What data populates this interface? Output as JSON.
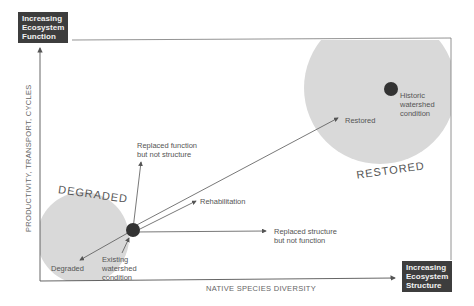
{
  "diagram": {
    "corner_labels": {
      "top_left": "Increasing Ecosystem Function",
      "top_left_lines": [
        "Increasing",
        "Ecosystem",
        "Function"
      ],
      "bottom_right": "Increasing Ecosystem Structure",
      "bottom_right_lines": [
        "Increasing",
        "Ecosystem",
        "Structure"
      ]
    },
    "axes": {
      "y_label": "PRODUCTIVITY, TRANSPORT, CYCLES",
      "x_label": "NATIVE SPECIES DIVERSITY"
    },
    "regions": {
      "degraded": "DEGRADED",
      "restored": "RESTORED"
    },
    "points": {
      "existing": [
        "Existing",
        "watershed",
        "condition"
      ],
      "historic": [
        "Historic",
        "watershed",
        "condition"
      ]
    },
    "arrows": {
      "replaced_function": [
        "Replaced function",
        "but not structure"
      ],
      "rehabilitation": "Rehabilitation",
      "replaced_structure": [
        "Replaced structure",
        "but not function"
      ],
      "restored": "Restored",
      "degraded": "Degraded"
    },
    "colors": {
      "region_fill": "#d9d9d9",
      "label_box": "#3d3d3d",
      "lines": "#555555",
      "dot": "#333333"
    }
  }
}
